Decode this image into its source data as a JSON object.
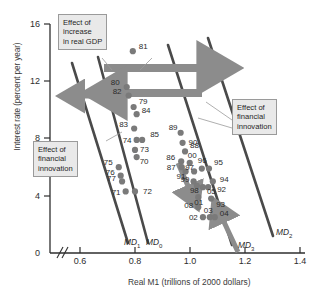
{
  "chart_data": {
    "type": "scatter",
    "title": "",
    "xlabel": "Real M1 (trillions of 2000 dollars)",
    "ylabel": "Interest rate (percent per year)",
    "xlim": [
      0.5,
      1.45
    ],
    "ylim": [
      0,
      17
    ],
    "xticks": [
      "0.6",
      "0.8",
      "1.0",
      "1.2",
      "1.4"
    ],
    "xtick_values": [
      0.6,
      0.8,
      1.0,
      1.2,
      1.4
    ],
    "yticks": [
      "0",
      "4",
      "8",
      "12",
      "16"
    ],
    "ytick_values": [
      0,
      4,
      8,
      12,
      16
    ],
    "axis_break": true,
    "grid": false,
    "legend": "none",
    "points": [
      {
        "label": "81",
        "x": 0.792,
        "y": 14.1
      },
      {
        "label": "80",
        "x": 0.77,
        "y": 11.6
      },
      {
        "label": "82",
        "x": 0.777,
        "y": 11.0
      },
      {
        "label": "79",
        "x": 0.795,
        "y": 10.2
      },
      {
        "label": "84",
        "x": 0.806,
        "y": 9.7
      },
      {
        "label": "83",
        "x": 0.797,
        "y": 8.7
      },
      {
        "label": "74",
        "x": 0.806,
        "y": 7.9
      },
      {
        "label": "85",
        "x": 0.826,
        "y": 7.9
      },
      {
        "label": "73",
        "x": 0.8,
        "y": 7.2
      },
      {
        "label": "70",
        "x": 0.806,
        "y": 6.7
      },
      {
        "label": "75",
        "x": 0.741,
        "y": 6.0
      },
      {
        "label": "76",
        "x": 0.748,
        "y": 5.4
      },
      {
        "label": "77",
        "x": 0.753,
        "y": 5.0
      },
      {
        "label": "71",
        "x": 0.766,
        "y": 4.3
      },
      {
        "label": "72",
        "x": 0.8,
        "y": 4.3
      },
      {
        "label": "89",
        "x": 0.966,
        "y": 8.4
      },
      {
        "label": "90",
        "x": 0.973,
        "y": 7.7
      },
      {
        "label": "88",
        "x": 0.982,
        "y": 7.1
      },
      {
        "label": "86",
        "x": 0.968,
        "y": 6.4
      },
      {
        "label": "87",
        "x": 0.97,
        "y": 6.0
      },
      {
        "label": "00",
        "x": 0.999,
        "y": 6.3
      },
      {
        "label": "91",
        "x": 0.984,
        "y": 5.7
      },
      {
        "label": "97",
        "x": 1.015,
        "y": 5.7
      },
      {
        "label": "96",
        "x": 1.043,
        "y": 5.9
      },
      {
        "label": "95",
        "x": 1.069,
        "y": 5.9
      },
      {
        "label": "99",
        "x": 1.013,
        "y": 5.0
      },
      {
        "label": "98",
        "x": 1.025,
        "y": 4.7
      },
      {
        "label": "05",
        "x": 1.047,
        "y": 4.6
      },
      {
        "label": "92",
        "x": 1.066,
        "y": 4.6
      },
      {
        "label": "94",
        "x": 1.083,
        "y": 5.0
      },
      {
        "label": "01",
        "x": 1.03,
        "y": 3.9
      },
      {
        "label": "93",
        "x": 1.077,
        "y": 3.8
      },
      {
        "label": "08",
        "x": 1.03,
        "y": 3.2
      },
      {
        "label": "02",
        "x": 1.047,
        "y": 2.5
      },
      {
        "label": "03",
        "x": 1.072,
        "y": 2.5
      },
      {
        "label": "04",
        "x": 1.09,
        "y": 2.5
      }
    ],
    "curves": [
      {
        "name": "MD1",
        "label": "MD",
        "sub": "1"
      },
      {
        "name": "MD0",
        "label": "MD",
        "sub": "0"
      },
      {
        "name": "MD3",
        "label": "MD",
        "sub": "3"
      },
      {
        "name": "MD2",
        "label": "MD",
        "sub": "2"
      }
    ],
    "annotations": [
      {
        "name": "effect-real-gdp",
        "lines": [
          "Effect of",
          "increase",
          "in real GDP"
        ]
      },
      {
        "name": "effect-financial-innovation-left",
        "lines": [
          "Effect of",
          "financial",
          "innovation"
        ]
      },
      {
        "name": "effect-financial-innovation-right",
        "lines": [
          "Effect of",
          "financial",
          "innovation"
        ]
      }
    ],
    "colors": {
      "point": "#7a7a7a",
      "curve": "#4a4a4a",
      "arrow": "#8c8c8c",
      "callout_bg": "#e9e9e9",
      "callout_border": "#9a9a9a",
      "axis": "#2e2e2e"
    }
  }
}
